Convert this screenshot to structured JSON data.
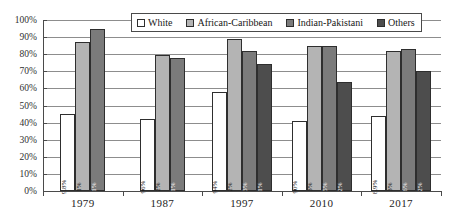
{
  "chart_data": {
    "type": "bar",
    "title": "",
    "subtitle": "",
    "xlabel": "",
    "ylabel": "",
    "categories": [
      "1979",
      "1987",
      "1997",
      "2010",
      "2017"
    ],
    "ylim": [
      0,
      100
    ],
    "ytick_labels": [
      "0%",
      "10%",
      "20%",
      "30%",
      "40%",
      "50%",
      "60%",
      "70%",
      "80%",
      "90%",
      "100%"
    ],
    "ytick_values": [
      0,
      10,
      20,
      30,
      40,
      50,
      60,
      70,
      80,
      90,
      100
    ],
    "grid": true,
    "legend_position": "top-center",
    "series": [
      {
        "name": "White",
        "color": "#ffffff",
        "values": [
          45,
          42,
          58,
          41,
          44
        ],
        "bar_labels": [
          "9.8%",
          "96%",
          "94%",
          "90%",
          "8.9%"
        ]
      },
      {
        "name": "African-Caribbean",
        "color": "#b4b4b4",
        "values": [
          87,
          79.5,
          89,
          85,
          82
        ],
        "bar_labels": [
          "1%",
          "2%",
          "2%",
          "3%",
          "3%"
        ]
      },
      {
        "name": "Indian-Pakistani",
        "color": "#7b7b7b",
        "values": [
          95,
          77.5,
          82,
          85,
          83
        ],
        "bar_labels": [
          "1%",
          "1%",
          "3%",
          "5%",
          "6%"
        ]
      },
      {
        "name": "Others",
        "color": "#4d4d4d",
        "values": [
          null,
          null,
          74,
          64,
          70
        ],
        "bar_labels": [
          null,
          null,
          "1%",
          "2%",
          "2%"
        ]
      }
    ]
  },
  "legend": {
    "items": [
      {
        "label": "White",
        "series": 0
      },
      {
        "label": "African-Caribbean",
        "series": 1
      },
      {
        "label": "Indian-Pakistani",
        "series": 2
      },
      {
        "label": "Others",
        "series": 3
      }
    ]
  }
}
